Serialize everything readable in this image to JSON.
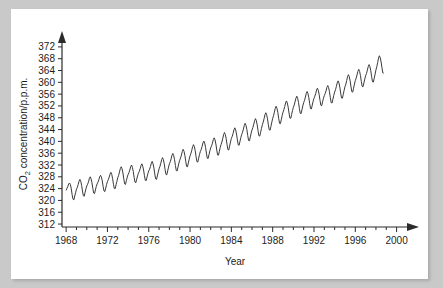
{
  "figure": {
    "background_color": "#c9c9c9",
    "panel_color": "#ffffff",
    "line_color": "#3a3a3a",
    "axis_color": "#2b2b2b"
  },
  "chart_data": {
    "type": "line",
    "title": "",
    "xlabel": "Year",
    "ylabel": "CO2 concentration/p.p.m.",
    "ylabel_main": "CO",
    "ylabel_sub": "2",
    "ylabel_rest": " concentration/p.p.m.",
    "xlim": [
      1967.6,
      2001.2
    ],
    "ylim": [
      311,
      374
    ],
    "grid": false,
    "legend": null,
    "x_major_ticks": [
      1968,
      1972,
      1976,
      1980,
      1984,
      1988,
      1992,
      1996,
      2000
    ],
    "x_major_tick_labels": [
      "1968",
      "1972",
      "1976",
      "1980",
      "1984",
      "1988",
      "1992",
      "1996",
      "2000"
    ],
    "x_minor_tick_step": 1,
    "y_major_ticks": [
      312,
      316,
      320,
      324,
      328,
      332,
      336,
      340,
      344,
      348,
      352,
      356,
      360,
      364,
      368,
      372
    ],
    "y_major_tick_labels": [
      "312",
      "316",
      "320",
      "324",
      "328",
      "332",
      "336",
      "340",
      "344",
      "348",
      "352",
      "356",
      "360",
      "364",
      "368",
      "372"
    ],
    "series": [
      {
        "name": "Mauna Loa monthly mean CO2",
        "x": [
          1968.0,
          1968.083,
          1968.167,
          1968.25,
          1968.333,
          1968.417,
          1968.5,
          1968.583,
          1968.667,
          1968.75,
          1968.833,
          1968.917,
          1969.0,
          1969.083,
          1969.167,
          1969.25,
          1969.333,
          1969.417,
          1969.5,
          1969.583,
          1969.667,
          1969.75,
          1969.833,
          1969.917,
          1970.0,
          1970.083,
          1970.167,
          1970.25,
          1970.333,
          1970.417,
          1970.5,
          1970.583,
          1970.667,
          1970.75,
          1970.833,
          1970.917,
          1971.0,
          1971.083,
          1971.167,
          1971.25,
          1971.333,
          1971.417,
          1971.5,
          1971.583,
          1971.667,
          1971.75,
          1971.833,
          1971.917,
          1972.0,
          1972.083,
          1972.167,
          1972.25,
          1972.333,
          1972.417,
          1972.5,
          1972.583,
          1972.667,
          1972.75,
          1972.833,
          1972.917,
          1973.0,
          1973.083,
          1973.167,
          1973.25,
          1973.333,
          1973.417,
          1973.5,
          1973.583,
          1973.667,
          1973.75,
          1973.833,
          1973.917,
          1974.0,
          1974.083,
          1974.167,
          1974.25,
          1974.333,
          1974.417,
          1974.5,
          1974.583,
          1974.667,
          1974.75,
          1974.833,
          1974.917,
          1975.0,
          1975.083,
          1975.167,
          1975.25,
          1975.333,
          1975.417,
          1975.5,
          1975.583,
          1975.667,
          1975.75,
          1975.833,
          1975.917,
          1976.0,
          1976.083,
          1976.167,
          1976.25,
          1976.333,
          1976.417,
          1976.5,
          1976.583,
          1976.667,
          1976.75,
          1976.833,
          1976.917,
          1977.0,
          1977.083,
          1977.167,
          1977.25,
          1977.333,
          1977.417,
          1977.5,
          1977.583,
          1977.667,
          1977.75,
          1977.833,
          1977.917,
          1978.0,
          1978.083,
          1978.167,
          1978.25,
          1978.333,
          1978.417,
          1978.5,
          1978.583,
          1978.667,
          1978.75,
          1978.833,
          1978.917,
          1979.0,
          1979.083,
          1979.167,
          1979.25,
          1979.333,
          1979.417,
          1979.5,
          1979.583,
          1979.667,
          1979.75,
          1979.833,
          1979.917,
          1980.0,
          1980.083,
          1980.167,
          1980.25,
          1980.333,
          1980.417,
          1980.5,
          1980.583,
          1980.667,
          1980.75,
          1980.833,
          1980.917,
          1981.0,
          1981.083,
          1981.167,
          1981.25,
          1981.333,
          1981.417,
          1981.5,
          1981.583,
          1981.667,
          1981.75,
          1981.833,
          1981.917,
          1982.0,
          1982.083,
          1982.167,
          1982.25,
          1982.333,
          1982.417,
          1982.5,
          1982.583,
          1982.667,
          1982.75,
          1982.833,
          1982.917,
          1983.0,
          1983.083,
          1983.167,
          1983.25,
          1983.333,
          1983.417,
          1983.5,
          1983.583,
          1983.667,
          1983.75,
          1983.833,
          1983.917,
          1984.0,
          1984.083,
          1984.167,
          1984.25,
          1984.333,
          1984.417,
          1984.5,
          1984.583,
          1984.667,
          1984.75,
          1984.833,
          1984.917,
          1985.0,
          1985.083,
          1985.167,
          1985.25,
          1985.333,
          1985.417,
          1985.5,
          1985.583,
          1985.667,
          1985.75,
          1985.833,
          1985.917,
          1986.0,
          1986.083,
          1986.167,
          1986.25,
          1986.333,
          1986.417,
          1986.5,
          1986.583,
          1986.667,
          1986.75,
          1986.833,
          1986.917,
          1987.0,
          1987.083,
          1987.167,
          1987.25,
          1987.333,
          1987.417,
          1987.5,
          1987.583,
          1987.667,
          1987.75,
          1987.833,
          1987.917,
          1988.0,
          1988.083,
          1988.167,
          1988.25,
          1988.333,
          1988.417,
          1988.5,
          1988.583,
          1988.667,
          1988.75,
          1988.833,
          1988.917,
          1989.0,
          1989.083,
          1989.167,
          1989.25,
          1989.333,
          1989.417,
          1989.5,
          1989.583,
          1989.667,
          1989.75,
          1989.833,
          1989.917,
          1990.0,
          1990.083,
          1990.167,
          1990.25,
          1990.333,
          1990.417,
          1990.5,
          1990.583,
          1990.667,
          1990.75,
          1990.833,
          1990.917,
          1991.0,
          1991.083,
          1991.167,
          1991.25,
          1991.333,
          1991.417,
          1991.5,
          1991.583,
          1991.667,
          1991.75,
          1991.833,
          1991.917,
          1992.0,
          1992.083,
          1992.167,
          1992.25,
          1992.333,
          1992.417,
          1992.5,
          1992.583,
          1992.667,
          1992.75,
          1992.833,
          1992.917,
          1993.0,
          1993.083,
          1993.167,
          1993.25,
          1993.333,
          1993.417,
          1993.5,
          1993.583,
          1993.667,
          1993.75,
          1993.833,
          1993.917,
          1994.0,
          1994.083,
          1994.167,
          1994.25,
          1994.333,
          1994.417,
          1994.5,
          1994.583,
          1994.667,
          1994.75,
          1994.833,
          1994.917,
          1995.0,
          1995.083,
          1995.167,
          1995.25,
          1995.333,
          1995.417,
          1995.5,
          1995.583,
          1995.667,
          1995.75,
          1995.833,
          1995.917,
          1996.0,
          1996.083,
          1996.167,
          1996.25,
          1996.333,
          1996.417,
          1996.5,
          1996.583,
          1996.667,
          1996.75,
          1996.833,
          1996.917,
          1997.0,
          1997.083,
          1997.167,
          1997.25,
          1997.333,
          1997.417,
          1997.5,
          1997.583,
          1997.667,
          1997.75,
          1997.833,
          1997.917,
          1998.0,
          1998.083,
          1998.167,
          1998.25,
          1998.333,
          1998.417,
          1998.5,
          1998.583,
          1998.667,
          1998.75
        ],
        "y": [
          323.4,
          324.1,
          324.8,
          325.6,
          325.9,
          325.3,
          323.9,
          321.9,
          320.4,
          320.2,
          321.5,
          322.6,
          323.8,
          324.4,
          325.4,
          326.5,
          327.1,
          326.5,
          325.1,
          323.2,
          321.6,
          321.4,
          322.7,
          323.9,
          324.9,
          325.5,
          326.3,
          327.5,
          328.0,
          327.3,
          326.0,
          324.1,
          322.5,
          322.3,
          323.5,
          324.7,
          325.6,
          326.2,
          327.0,
          328.0,
          328.5,
          327.9,
          326.6,
          324.7,
          323.2,
          323.0,
          324.2,
          325.4,
          326.4,
          327.0,
          327.9,
          328.9,
          329.5,
          328.8,
          327.4,
          325.5,
          324.0,
          324.0,
          325.3,
          326.5,
          327.7,
          328.5,
          329.6,
          330.8,
          331.4,
          330.7,
          329.3,
          327.3,
          325.6,
          325.4,
          326.7,
          327.9,
          328.8,
          329.4,
          330.3,
          331.4,
          332.0,
          331.2,
          329.8,
          327.8,
          326.2,
          326.0,
          327.2,
          328.3,
          329.2,
          329.8,
          330.7,
          331.8,
          332.4,
          331.6,
          330.3,
          328.4,
          326.8,
          326.7,
          327.9,
          329.1,
          330.0,
          330.6,
          331.5,
          332.6,
          333.2,
          332.4,
          331.0,
          329.0,
          327.3,
          327.1,
          328.3,
          329.6,
          330.7,
          331.5,
          332.6,
          333.8,
          334.5,
          333.8,
          332.4,
          330.4,
          328.8,
          328.7,
          330.0,
          331.3,
          332.4,
          333.1,
          334.1,
          335.3,
          335.9,
          335.2,
          333.8,
          331.8,
          330.1,
          330.0,
          331.3,
          332.6,
          333.6,
          334.4,
          335.4,
          336.6,
          337.3,
          336.6,
          335.2,
          333.2,
          331.5,
          331.4,
          332.7,
          334.0,
          335.1,
          335.9,
          337.0,
          338.2,
          338.9,
          338.2,
          336.8,
          334.8,
          333.1,
          333.0,
          334.3,
          335.6,
          336.6,
          337.3,
          338.3,
          339.5,
          340.1,
          339.4,
          338.0,
          336.0,
          334.3,
          334.2,
          335.5,
          336.8,
          337.8,
          338.5,
          339.4,
          340.6,
          341.2,
          340.5,
          339.1,
          337.1,
          335.4,
          335.3,
          336.6,
          337.9,
          338.9,
          339.8,
          341.0,
          342.3,
          343.0,
          342.3,
          340.9,
          338.9,
          337.2,
          337.1,
          338.4,
          339.8,
          341.0,
          341.7,
          342.7,
          343.9,
          344.6,
          343.9,
          342.5,
          340.5,
          338.8,
          338.7,
          340.0,
          341.3,
          342.3,
          343.1,
          344.2,
          345.4,
          346.1,
          345.4,
          344.0,
          342.0,
          340.3,
          340.2,
          341.5,
          342.8,
          343.9,
          344.7,
          345.8,
          347.0,
          347.7,
          347.0,
          345.6,
          343.6,
          341.9,
          341.8,
          343.1,
          344.4,
          345.6,
          346.5,
          347.7,
          349.0,
          349.7,
          349.0,
          347.6,
          345.6,
          343.9,
          343.8,
          345.1,
          346.5,
          347.8,
          348.7,
          349.9,
          351.2,
          351.9,
          351.2,
          349.8,
          347.8,
          346.1,
          346.0,
          347.3,
          348.7,
          349.9,
          350.7,
          351.8,
          353.0,
          353.7,
          353.0,
          351.6,
          349.6,
          347.9,
          347.8,
          349.1,
          350.4,
          351.5,
          352.3,
          353.4,
          354.6,
          355.3,
          354.6,
          353.2,
          351.2,
          349.5,
          349.4,
          350.7,
          352.0,
          353.1,
          353.9,
          355.0,
          356.2,
          356.9,
          356.2,
          354.8,
          352.8,
          351.1,
          351.0,
          352.3,
          353.6,
          354.6,
          355.3,
          356.2,
          357.4,
          358.0,
          357.3,
          355.9,
          353.9,
          352.2,
          352.1,
          353.4,
          354.6,
          355.5,
          356.2,
          357.1,
          358.3,
          358.9,
          358.2,
          356.8,
          354.8,
          353.1,
          353.0,
          354.3,
          355.6,
          356.7,
          357.5,
          358.6,
          359.8,
          360.5,
          359.8,
          358.4,
          356.4,
          354.7,
          354.6,
          355.9,
          357.3,
          358.5,
          359.4,
          360.6,
          361.9,
          362.6,
          361.9,
          360.5,
          358.5,
          356.8,
          356.7,
          358.0,
          359.4,
          360.6,
          361.4,
          362.5,
          363.7,
          364.4,
          363.7,
          362.3,
          360.3,
          358.6,
          358.5,
          359.8,
          361.1,
          362.2,
          363.0,
          364.1,
          365.3,
          366.0,
          365.3,
          363.9,
          361.9,
          360.2,
          360.1,
          361.4,
          362.8,
          364.2,
          365.3,
          366.7,
          368.2,
          369.0,
          368.3,
          366.9,
          364.9,
          363.2,
          363.1
        ]
      }
    ]
  }
}
